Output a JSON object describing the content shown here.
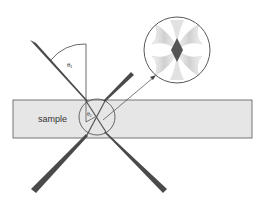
{
  "diagram": {
    "sample_label": "sample",
    "angle_outer_label": "θ₁",
    "angle_inner_label": "θ₂",
    "inset_description": "magnified beam overlap region"
  },
  "colors": {
    "sample_fill": "#e6e6e6",
    "sample_stroke": "#555555",
    "beam": "#4a4a4a",
    "beam_highlight": "#7a7a7a",
    "line": "#444444",
    "overlap_diamond": "#555555",
    "inset_lobe": "#d9d9d9"
  }
}
